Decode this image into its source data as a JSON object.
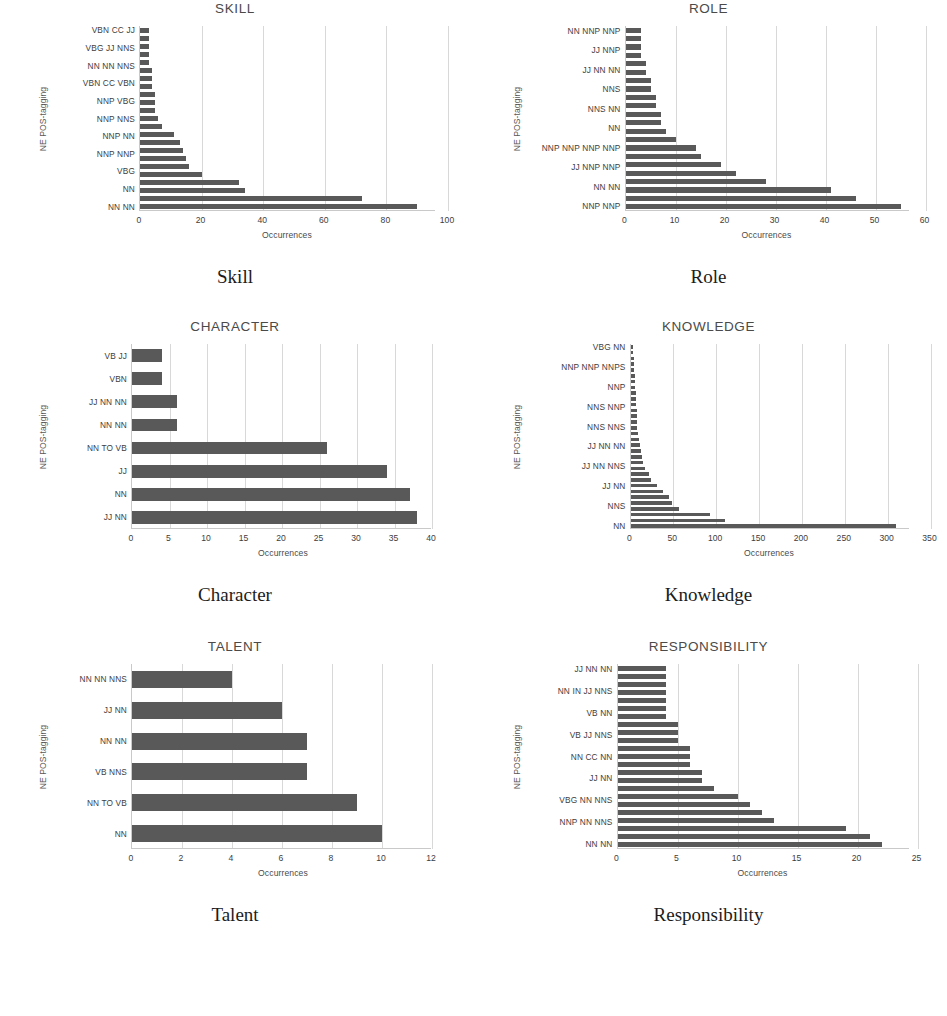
{
  "page": {
    "axis_title_y": "NE POS-tagging",
    "axis_title_x": "Occurrences",
    "bar_color": "#595959",
    "gridline_color": "#d8d8d8",
    "axis_color": "#c9c9c9"
  },
  "figures": [
    {
      "caption": "Skill",
      "chart_data": {
        "type": "bar",
        "orientation": "horizontal",
        "title": "SKILL",
        "xlabel": "Occurrences",
        "ylabel": "NE POS-tagging",
        "xlim": [
          0,
          100
        ],
        "xticks": [
          0,
          20,
          40,
          60,
          80,
          100
        ],
        "grid": true,
        "legend": "none",
        "categories": [
          "VBN CC JJ",
          "",
          "VBG JJ NNS",
          "",
          "NN NN NNS",
          "",
          "VBN CC VBN",
          "",
          "NNP VBG",
          "",
          "NNP NNS",
          "",
          "NNP NN",
          "",
          "NNP NNP",
          "",
          "VBG",
          "",
          "NN",
          "",
          "NN NN"
        ],
        "tick_labels_visible": [
          "VBN CC JJ",
          "VBG JJ NNS",
          "NN NN NNS",
          "VBN CC VBN",
          "NNP VBG",
          "NNP NNS",
          "NNP NN",
          "NNP NNP",
          "VBG",
          "NN",
          "NN NN"
        ],
        "values": [
          3,
          3,
          3,
          3,
          3,
          4,
          4,
          4,
          5,
          5,
          5,
          6,
          7,
          11,
          13,
          14,
          15,
          16,
          20,
          32,
          34,
          72,
          90
        ]
      }
    },
    {
      "caption": "Role",
      "chart_data": {
        "type": "bar",
        "orientation": "horizontal",
        "title": "ROLE",
        "xlabel": "Occurrences",
        "ylabel": "NE POS-tagging",
        "xlim": [
          0,
          60
        ],
        "xticks": [
          0,
          10,
          20,
          30,
          40,
          50,
          60
        ],
        "grid": true,
        "legend": "none",
        "categories": [
          "NN NNP NNP",
          "",
          "JJ NNP",
          "",
          "JJ NN NN",
          "",
          "NNS",
          "",
          "NNS NN",
          "",
          "NN",
          "",
          "NNP NNP NNP NNP",
          "",
          "JJ NNP NNP",
          "",
          "NN NN",
          "",
          "NNP NNP"
        ],
        "tick_labels_visible": [
          "NN NNP NNP",
          "JJ NNP",
          "JJ NN NN",
          "NNS",
          "NNS NN",
          "NN",
          "NNP NNP NNP NNP",
          "JJ NNP NNP",
          "NN NN",
          "NNP NNP"
        ],
        "values": [
          3,
          3,
          3,
          3,
          4,
          4,
          5,
          5,
          6,
          6,
          7,
          7,
          8,
          10,
          14,
          15,
          19,
          22,
          28,
          41,
          46,
          55
        ]
      }
    },
    {
      "caption": "Character",
      "chart_data": {
        "type": "bar",
        "orientation": "horizontal",
        "title": "CHARACTER",
        "xlabel": "Occurrences",
        "ylabel": "NE POS-tagging",
        "xlim": [
          0,
          40
        ],
        "xticks": [
          0,
          5,
          10,
          15,
          20,
          25,
          30,
          35,
          40
        ],
        "grid": true,
        "legend": "none",
        "categories": [
          "VB JJ",
          "VBN",
          "JJ NN NN",
          "NN NN",
          "NN TO VB",
          "JJ",
          "NN",
          "JJ NN"
        ],
        "tick_labels_visible": [
          "VB JJ",
          "VBN",
          "JJ NN NN",
          "NN NN",
          "NN TO VB",
          "JJ",
          "NN",
          "JJ NN"
        ],
        "values": [
          4,
          4,
          6,
          6,
          26,
          34,
          37,
          38
        ]
      }
    },
    {
      "caption": "Knowledge",
      "chart_data": {
        "type": "bar",
        "orientation": "horizontal",
        "title": "KNOWLEDGE",
        "xlabel": "Occurrences",
        "ylabel": "NE POS-tagging",
        "xlim": [
          0,
          350
        ],
        "xticks": [
          0,
          50,
          100,
          150,
          200,
          250,
          300,
          350
        ],
        "grid": true,
        "legend": "none",
        "categories": [
          "VBG NN",
          "",
          "",
          "NNP NNP NNPS",
          "",
          "",
          "NNP",
          "",
          "",
          "NNS NNP",
          "",
          "",
          "NNS NNS",
          "",
          "",
          "JJ NN NN",
          "",
          "",
          "JJ NN NNS",
          "",
          "",
          "JJ NN",
          "",
          "",
          "NNS",
          "",
          "",
          "NN"
        ],
        "tick_labels_visible": [
          "VBG NN",
          "NNP NNP NNPS",
          "NNP",
          "NNS NNP",
          "NNS NNS",
          "JJ NN NN",
          "JJ NN NNS",
          "JJ NN",
          "NNS",
          "NN"
        ],
        "values": [
          3,
          3,
          4,
          4,
          4,
          5,
          5,
          5,
          6,
          6,
          6,
          7,
          7,
          8,
          8,
          9,
          10,
          11,
          12,
          13,
          15,
          17,
          21,
          24,
          31,
          38,
          45,
          48,
          57,
          93,
          110,
          310
        ]
      }
    },
    {
      "caption": "Talent",
      "chart_data": {
        "type": "bar",
        "orientation": "horizontal",
        "title": "TALENT",
        "xlabel": "Occurrences",
        "ylabel": "NE POS-tagging",
        "xlim": [
          0,
          12
        ],
        "xticks": [
          0,
          2,
          4,
          6,
          8,
          10,
          12
        ],
        "grid": true,
        "legend": "none",
        "categories": [
          "NN NN NNS",
          "JJ NN",
          "NN NN",
          "VB NNS",
          "NN TO VB",
          "NN"
        ],
        "tick_labels_visible": [
          "NN NN NNS",
          "JJ NN",
          "NN NN",
          "VB NNS",
          "NN TO VB",
          "NN"
        ],
        "values": [
          4,
          6,
          7,
          7,
          9,
          10
        ]
      }
    },
    {
      "caption": "Responsibility",
      "chart_data": {
        "type": "bar",
        "orientation": "horizontal",
        "title": "RESPONSIBILITY",
        "xlabel": "Occurrences",
        "ylabel": "NE POS-tagging",
        "xlim": [
          0,
          25
        ],
        "xticks": [
          0,
          5,
          10,
          15,
          20,
          25
        ],
        "grid": true,
        "legend": "none",
        "categories": [
          "JJ NN NN",
          "",
          "NN IN JJ NNS",
          "",
          "VB NN",
          "",
          "VB JJ NNS",
          "",
          "NN CC NN",
          "",
          "JJ NN",
          "",
          "VBG NN NNS",
          "",
          "NNP NN NNS",
          "",
          "NN NN"
        ],
        "tick_labels_visible": [
          "JJ NN NN",
          "NN IN JJ NNS",
          "VB NN",
          "VB JJ NNS",
          "NN CC NN",
          "JJ NN",
          "VBG NN NNS",
          "NNP NN NNS",
          "NN NN"
        ],
        "values": [
          4,
          4,
          4,
          4,
          4,
          4,
          4,
          5,
          5,
          5,
          6,
          6,
          6,
          7,
          7,
          8,
          10,
          11,
          12,
          13,
          19,
          21,
          22
        ]
      }
    }
  ]
}
